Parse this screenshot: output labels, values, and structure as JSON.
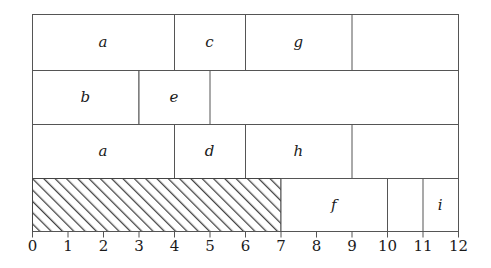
{
  "chart_data": {
    "type": "bar",
    "title": "",
    "xlabel": "",
    "ylabel": "",
    "xlim": [
      0,
      12
    ],
    "ylim": [
      0,
      4
    ],
    "grid": false,
    "legend": "none",
    "orientation": "horizontal",
    "x_ticks": [
      0,
      1,
      2,
      3,
      4,
      5,
      6,
      7,
      8,
      9,
      10,
      11,
      12
    ],
    "x_tick_labels": [
      "0",
      "1",
      "2",
      "3",
      "4",
      "5",
      "6",
      "7",
      "8",
      "9",
      "10",
      "11",
      "12"
    ],
    "rows": [
      {
        "row": 1,
        "row_index_from_top": 0,
        "frame_start": 0,
        "frame_end": 12,
        "blocks": [
          {
            "label": "a",
            "start": 0,
            "end": 4,
            "hatched": false
          },
          {
            "label": "c",
            "start": 4,
            "end": 6,
            "hatched": false
          },
          {
            "label": "g",
            "start": 6,
            "end": 9,
            "hatched": false
          }
        ]
      },
      {
        "row": 2,
        "row_index_from_top": 1,
        "frame_start": 0,
        "frame_end": 12,
        "blocks": [
          {
            "label": "b",
            "start": 0,
            "end": 3,
            "hatched": false
          },
          {
            "label": "e",
            "start": 3,
            "end": 5,
            "hatched": false
          }
        ]
      },
      {
        "row": 3,
        "row_index_from_top": 2,
        "frame_start": 0,
        "frame_end": 12,
        "blocks": [
          {
            "label": "a",
            "start": 0,
            "end": 4,
            "hatched": false
          },
          {
            "label": "d",
            "start": 4,
            "end": 6,
            "hatched": false
          },
          {
            "label": "h",
            "start": 6,
            "end": 9,
            "hatched": false
          }
        ]
      },
      {
        "row": 4,
        "row_index_from_top": 3,
        "frame_start": 0,
        "frame_end": 12,
        "blocks": [
          {
            "label": "",
            "start": 0,
            "end": 7,
            "hatched": true
          },
          {
            "label": "f",
            "start": 7,
            "end": 10,
            "hatched": false
          },
          {
            "label": "i",
            "start": 11,
            "end": 12,
            "hatched": false
          }
        ]
      }
    ],
    "labels_in_order": [
      "a",
      "c",
      "g",
      "b",
      "e",
      "a",
      "d",
      "h",
      "f",
      "i"
    ],
    "colors": {
      "background": "#ffffff",
      "stroke": "#555555",
      "hatch": "#444444",
      "text": "#1a1a1a"
    }
  },
  "geometry": {
    "x_origin_px": 32,
    "unit_px": 35.5,
    "row_tops_px": [
      14,
      70,
      124,
      178
    ],
    "row_bottom_px": 231,
    "tick_len_px": 6,
    "tick_label_y_px": 240
  }
}
